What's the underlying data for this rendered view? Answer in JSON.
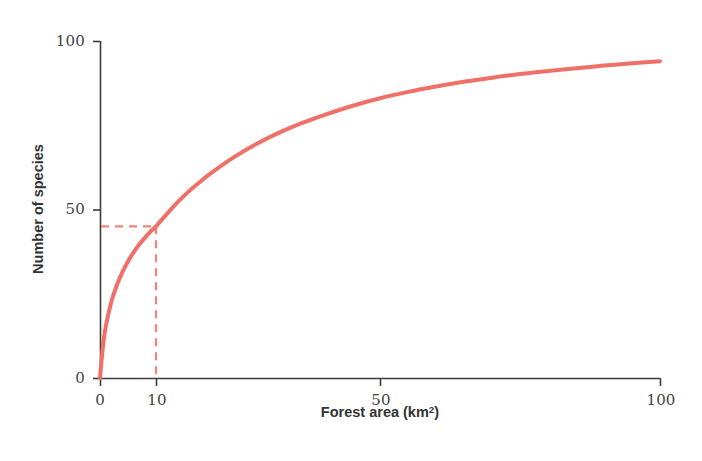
{
  "chart_data": {
    "type": "line",
    "title": "",
    "subtitle": "",
    "xlabel": "Forest area (km",
    "xlabel_sup": "2",
    "xlabel_suffix": ")",
    "xlabel_full": "Forest area (km²)",
    "ylabel": "Number of species",
    "xlim": [
      0,
      100
    ],
    "ylim": [
      0,
      100
    ],
    "xticks": [
      0,
      10,
      50,
      100
    ],
    "xtick_labels": [
      "0",
      "10",
      "50",
      "100"
    ],
    "yticks": [
      0,
      50,
      100
    ],
    "ytick_labels": [
      "0",
      "50",
      "100"
    ],
    "grid": false,
    "legend": "none",
    "series": [
      {
        "name": "Species-area curve",
        "color": "#F07068",
        "line_width": 4,
        "style": "solid",
        "x": [
          0,
          0.5,
          1,
          2,
          3,
          4,
          5,
          6,
          7,
          8,
          9,
          10,
          12,
          14,
          16,
          18,
          20,
          24,
          28,
          32,
          36,
          40,
          45,
          50,
          55,
          60,
          65,
          70,
          75,
          80,
          85,
          90,
          95,
          100
        ],
        "y": [
          0,
          9.0,
          15.0,
          22.5,
          27.5,
          31.4,
          34.6,
          37.3,
          39.6,
          41.6,
          43.4,
          45.0,
          48.8,
          52.4,
          55.6,
          58.4,
          61.0,
          65.6,
          69.5,
          72.8,
          75.6,
          78.0,
          80.7,
          83.0,
          84.9,
          86.5,
          87.9,
          89.1,
          90.2,
          91.1,
          91.9,
          92.7,
          93.4,
          94.0
        ]
      }
    ],
    "annotations": [
      {
        "name": "guide-lines",
        "kind": "dashed-crosshair",
        "x_value": 10,
        "y_value": 45,
        "color": "#F4827C",
        "style": "dashed",
        "line_width": 2
      }
    ],
    "axis_color": "#3C3C3C",
    "background": "#FFFFFF"
  },
  "axes": {
    "x_pixel_min": 100,
    "x_pixel_max": 660,
    "y_pixel_zero": 378,
    "y_pixel_max": 41
  }
}
